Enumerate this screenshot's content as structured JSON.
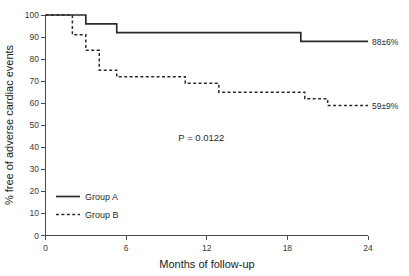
{
  "chart_data": {
    "type": "line",
    "subtype": "kaplan-meier-step",
    "title": "",
    "xlabel": "Months of follow-up",
    "ylabel": "% free of adverse cardiac events",
    "xlim": [
      0,
      24
    ],
    "ylim": [
      0,
      100
    ],
    "xticks": [
      0,
      6,
      12,
      18,
      24
    ],
    "xtick_labels": [
      "0",
      "6",
      "12",
      "18",
      "24"
    ],
    "yticks": [
      0,
      10,
      20,
      30,
      40,
      50,
      60,
      70,
      80,
      90,
      100
    ],
    "ytick_labels": [
      "0",
      "10",
      "20",
      "30",
      "40",
      "50",
      "60",
      "70",
      "80",
      "90",
      "100"
    ],
    "grid": false,
    "legend_position": "lower-left",
    "background_color": "#ffffff",
    "series": [
      {
        "name": "Group A",
        "style": "solid",
        "color": "#2b2b2b",
        "endpoint_label": "88±6%",
        "x": [
          0,
          3.0,
          3.0,
          5.3,
          5.3,
          19.0,
          19.0,
          24.0
        ],
        "y": [
          100,
          100,
          96,
          96,
          92,
          92,
          88,
          88
        ],
        "steps": [
          {
            "month": 0.0,
            "percent": 100
          },
          {
            "month": 3.0,
            "percent": 96
          },
          {
            "month": 5.3,
            "percent": 92
          },
          {
            "month": 19.0,
            "percent": 88
          },
          {
            "month": 24.0,
            "percent": 88
          }
        ]
      },
      {
        "name": "Group B",
        "style": "dashed",
        "color": "#2b2b2b",
        "endpoint_label": "59±9%",
        "x": [
          0,
          2.0,
          2.0,
          3.0,
          3.0,
          4.0,
          4.0,
          5.3,
          5.3,
          10.4,
          10.4,
          12.9,
          12.9,
          19.3,
          19.3,
          21.0,
          21.0,
          24.0
        ],
        "y": [
          100,
          100,
          91,
          91,
          84,
          84,
          75,
          75,
          72,
          72,
          69,
          69,
          65,
          65,
          62,
          62,
          59,
          59
        ],
        "steps": [
          {
            "month": 0.0,
            "percent": 100
          },
          {
            "month": 2.0,
            "percent": 91
          },
          {
            "month": 3.0,
            "percent": 84
          },
          {
            "month": 4.0,
            "percent": 75
          },
          {
            "month": 5.3,
            "percent": 72
          },
          {
            "month": 10.4,
            "percent": 69
          },
          {
            "month": 12.9,
            "percent": 65
          },
          {
            "month": 19.3,
            "percent": 62
          },
          {
            "month": 21.0,
            "percent": 59
          },
          {
            "month": 24.0,
            "percent": 59
          }
        ]
      }
    ],
    "annotations": [
      {
        "name": "p-value",
        "text": "P = 0.0122",
        "x": 11.6,
        "y": 43
      }
    ]
  },
  "legend": {
    "items": [
      {
        "label": "Group A",
        "style": "solid"
      },
      {
        "label": "Group B",
        "style": "dashed"
      }
    ]
  },
  "axes": {
    "x_title": "Months of follow-up",
    "y_title": "% free of adverse cardiac events"
  },
  "annotations": {
    "pvalue": "P = 0.0122",
    "group_a_endpoint": "88±6%",
    "group_b_endpoint": "59±9%"
  }
}
